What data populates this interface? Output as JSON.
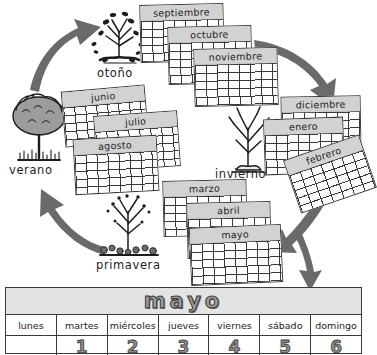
{
  "poster": {
    "language": "es",
    "topic": "Las estaciones del año y los meses",
    "ink_color": "#3a3a3a",
    "band_color": "#d2d2d2",
    "paper_color": "#ffffff"
  },
  "seasons": [
    {
      "key": "otono",
      "label": "otoño",
      "tree_icon": "falling-leaves-tree-icon",
      "months": [
        "septiembre",
        "octubre",
        "noviembre"
      ]
    },
    {
      "key": "invierno",
      "label": "invierno",
      "tree_icon": "bare-tree-icon",
      "months": [
        "diciembre",
        "enero",
        "febrero"
      ]
    },
    {
      "key": "primavera",
      "label": "primavera",
      "tree_icon": "budding-tree-icon",
      "months": [
        "marzo",
        "abril",
        "mayo"
      ]
    },
    {
      "key": "verano",
      "label": "verano",
      "tree_icon": "leafy-tree-icon",
      "months": [
        "junio",
        "julio",
        "agosto"
      ]
    }
  ],
  "arrows": [
    {
      "name": "arrow-verano-to-otono",
      "from": "verano",
      "to": "otoño"
    },
    {
      "name": "arrow-otono-to-invierno",
      "from": "otoño",
      "to": "invierno"
    },
    {
      "name": "arrow-invierno-to-primavera",
      "from": "invierno",
      "to": "primavera"
    },
    {
      "name": "arrow-primavera-to-verano",
      "from": "primavera",
      "to": "verano"
    },
    {
      "name": "arrow-to-mayo-calendar",
      "from": "invierno",
      "to": "mayo"
    }
  ],
  "featured_calendar": {
    "month": "mayo",
    "weekdays": [
      "lunes",
      "martes",
      "miércoles",
      "jueves",
      "viernes",
      "sábado",
      "domingo"
    ],
    "first_row_days": [
      "",
      "1",
      "2",
      "3",
      "4",
      "5",
      "6"
    ]
  }
}
